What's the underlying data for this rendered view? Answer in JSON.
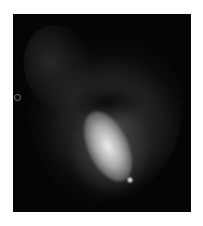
{
  "image": {
    "description": "Fluorescence micrograph of a cell with a bright mitotic spindle on a black background",
    "background_color": "#050505",
    "page_background": "#ffffff"
  }
}
